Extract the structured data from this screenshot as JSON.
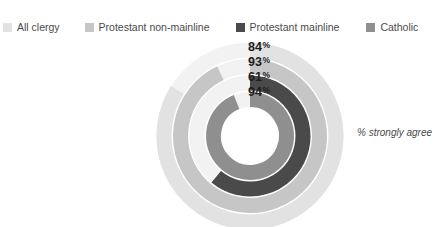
{
  "title_clipped": "",
  "legend": {
    "items": [
      {
        "label": "All clergy",
        "color": "#e2e2e2",
        "swatch_name": "legend-swatch-all-clergy"
      },
      {
        "label": "Protestant non-mainline",
        "color": "#c6c6c6",
        "swatch_name": "legend-swatch-protestant-non-mainline"
      },
      {
        "label": "Protestant mainline",
        "color": "#4a4a4a",
        "swatch_name": "legend-swatch-protestant-mainline"
      },
      {
        "label": "Catholic",
        "color": "#8f8f8f",
        "swatch_name": "legend-swatch-catholic"
      }
    ]
  },
  "value_labels": [
    {
      "value": "84",
      "suffix": "%"
    },
    {
      "value": "93",
      "suffix": "%"
    },
    {
      "value": "61",
      "suffix": "%"
    },
    {
      "value": "94",
      "suffix": "%"
    }
  ],
  "annotation": "% strongly agree",
  "chart_data": {
    "type": "bar",
    "subtype": "radial-bar",
    "title": "",
    "xlabel": "",
    "ylabel": "% strongly agree",
    "units": "percent",
    "ylim": [
      0,
      100
    ],
    "grid": false,
    "legend_position": "top",
    "start_angle_deg": 0,
    "direction": "clockwise",
    "categories": [
      "All clergy",
      "Protestant non-mainline",
      "Protestant mainline",
      "Catholic"
    ],
    "values": [
      84,
      93,
      61,
      94
    ],
    "ring_order_outer_to_inner": [
      "All clergy",
      "Protestant non-mainline",
      "Protestant mainline",
      "Catholic"
    ],
    "series": [
      {
        "name": "% strongly agree",
        "points": [
          {
            "category": "All clergy",
            "value": 84,
            "label": "84%",
            "color": "#e2e2e2",
            "ring": 1,
            "track_color": "#f2f2f2"
          },
          {
            "category": "Protestant non-mainline",
            "value": 93,
            "label": "93%",
            "color": "#c6c6c6",
            "ring": 2,
            "track_color": "#f2f2f2"
          },
          {
            "category": "Protestant mainline",
            "value": 61,
            "label": "61%",
            "color": "#4a4a4a",
            "ring": 3,
            "track_color": "#f2f2f2"
          },
          {
            "category": "Catholic",
            "value": 94,
            "label": "94%",
            "color": "#8f8f8f",
            "ring": 4,
            "track_color": "#f2f2f2"
          }
        ]
      }
    ]
  },
  "geometry": {
    "cx": 95,
    "cy": 104,
    "rings": [
      {
        "r": 86,
        "w": 15
      },
      {
        "r": 69.5,
        "w": 15
      },
      {
        "r": 53,
        "w": 15
      },
      {
        "r": 36.5,
        "w": 15
      }
    ]
  }
}
